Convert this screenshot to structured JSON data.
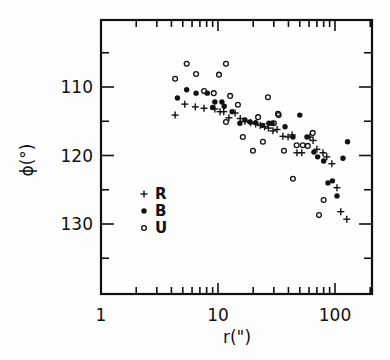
{
  "chart_data": {
    "type": "scatter",
    "title": "",
    "xlabel": "r(\")",
    "ylabel": "ϕ(°)",
    "xscale": "log",
    "xlim": [
      1,
      200
    ],
    "ylim": [
      100,
      140
    ],
    "y_inverted": true,
    "grid": false,
    "legend_position": "inside-left",
    "x_tick_labels": [
      "1",
      "10",
      "100"
    ],
    "y_tick_labels": [
      "110",
      "120",
      "130"
    ],
    "legend": [
      {
        "name": "R",
        "marker": "plus"
      },
      {
        "name": "B",
        "marker": "filled-circle"
      },
      {
        "name": "U",
        "marker": "open-circle"
      }
    ],
    "series": [
      {
        "name": "R",
        "marker": "plus",
        "points": [
          [
            4.3,
            114.1
          ],
          [
            5.2,
            112.5
          ],
          [
            6.4,
            112.9
          ],
          [
            7.6,
            113.1
          ],
          [
            9.4,
            113.2
          ],
          [
            10.4,
            113.6
          ],
          [
            11.2,
            113.6
          ],
          [
            12.4,
            114.5
          ],
          [
            14.0,
            113.8
          ],
          [
            15.5,
            114.6
          ],
          [
            17.0,
            115.0
          ],
          [
            19.0,
            115.2
          ],
          [
            21.0,
            115.4
          ],
          [
            23.0,
            115.6
          ],
          [
            25.0,
            115.8
          ],
          [
            27.0,
            116.0
          ],
          [
            29.5,
            116.4
          ],
          [
            32.0,
            116.2
          ],
          [
            35.9,
            117.2
          ],
          [
            39.7,
            117.3
          ],
          [
            43.0,
            117.0
          ],
          [
            47.3,
            119.6
          ],
          [
            52.0,
            119.6
          ],
          [
            61.0,
            117.3
          ],
          [
            65.0,
            117.8
          ],
          [
            70.0,
            119.1
          ],
          [
            79.0,
            119.6
          ],
          [
            85.0,
            120.2
          ],
          [
            94.0,
            121.2
          ],
          [
            104.0,
            124.7
          ],
          [
            112.0,
            128.2
          ],
          [
            126.0,
            129.3
          ]
        ]
      },
      {
        "name": "B",
        "marker": "filled-circle",
        "points": [
          [
            4.5,
            111.6
          ],
          [
            5.4,
            110.4
          ],
          [
            6.5,
            110.9
          ],
          [
            8.1,
            110.9
          ],
          [
            9.4,
            112.2
          ],
          [
            10.8,
            112.2
          ],
          [
            9.0,
            113.0
          ],
          [
            11.3,
            112.8
          ],
          [
            13.2,
            113.6
          ],
          [
            15.4,
            115.3
          ],
          [
            18.8,
            115.1
          ],
          [
            17.0,
            114.8
          ],
          [
            21.0,
            115.2
          ],
          [
            24.0,
            115.6
          ],
          [
            27.2,
            115.3
          ],
          [
            29.0,
            115.3
          ],
          [
            37.4,
            115.8
          ],
          [
            43.7,
            117.3
          ],
          [
            50.0,
            114.1
          ],
          [
            57.6,
            117.3
          ],
          [
            66.0,
            119.5
          ],
          [
            71.0,
            120.2
          ],
          [
            80.0,
            120.8
          ],
          [
            87.0,
            124.0
          ],
          [
            95.0,
            123.7
          ],
          [
            104.0,
            125.9
          ],
          [
            117.0,
            120.4
          ],
          [
            128.0,
            118.0
          ]
        ]
      },
      {
        "name": "U",
        "marker": "open-circle",
        "points": [
          [
            4.3,
            108.8
          ],
          [
            5.4,
            106.6
          ],
          [
            6.5,
            108.1
          ],
          [
            7.6,
            110.6
          ],
          [
            9.2,
            110.9
          ],
          [
            10.2,
            108.2
          ],
          [
            11.7,
            106.6
          ],
          [
            12.7,
            111.3
          ],
          [
            14.8,
            112.6
          ],
          [
            11.7,
            115.1
          ],
          [
            16.3,
            117.3
          ],
          [
            19.9,
            119.3
          ],
          [
            22.0,
            114.4
          ],
          [
            24.2,
            118.0
          ],
          [
            26.7,
            111.5
          ],
          [
            30.0,
            115.3
          ],
          [
            32.6,
            113.9
          ],
          [
            33.0,
            114.1
          ],
          [
            36.6,
            119.3
          ],
          [
            43.7,
            123.4
          ],
          [
            47.0,
            118.5
          ],
          [
            53.0,
            118.5
          ],
          [
            58.5,
            118.6
          ],
          [
            64.5,
            116.7
          ],
          [
            73.0,
            128.7
          ],
          [
            80.0,
            126.5
          ]
        ]
      }
    ]
  },
  "axes": {
    "x_title": "r(\")",
    "y_title": "ϕ(°)",
    "x_ticks": [
      {
        "label": "1",
        "value": 1
      },
      {
        "label": "10",
        "value": 10
      },
      {
        "label": "100",
        "value": 100
      }
    ],
    "y_ticks": [
      {
        "label": "110",
        "value": 110
      },
      {
        "label": "120",
        "value": 120
      },
      {
        "label": "130",
        "value": 130
      }
    ]
  },
  "legend": {
    "items": [
      {
        "symbol": "+",
        "label": "R"
      },
      {
        "symbol": "•",
        "label": "B"
      },
      {
        "symbol": "○",
        "label": "U"
      }
    ]
  }
}
